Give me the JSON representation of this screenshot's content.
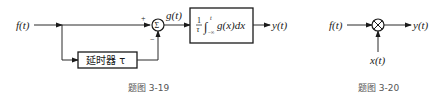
{
  "figure_3_19": {
    "input_label": "f(t)",
    "sum_node_symbol": "Σ",
    "plus_sign": "+",
    "minus_sign": "−",
    "sum_output_label": "g(t)",
    "delay_block_label": "延时器 τ",
    "integrator": {
      "fraction_num": "1",
      "fraction_den": "τ",
      "integral_sign": "∫",
      "upper_limit": "t",
      "lower_limit": "−∞",
      "integrand": "g(x)dx"
    },
    "output_label": "y(t)",
    "caption": "题图 3-19"
  },
  "figure_3_20": {
    "input_label": "f(t)",
    "multiplier_symbol": "×",
    "side_input_label": "x(t)",
    "output_label": "y(t)",
    "caption": "题图 3-20"
  }
}
